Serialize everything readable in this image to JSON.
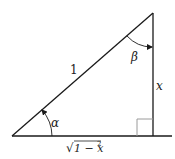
{
  "diagram": {
    "type": "right-triangle",
    "colors": {
      "stroke": "#1a1a1a",
      "right_angle_marker": "#9a9a9a",
      "text": "#222222"
    },
    "labels": {
      "hypotenuse": "1",
      "vertical_side": "x",
      "base": "√1 − x²",
      "base_radicand": "1 − x",
      "base_exponent": "2",
      "base_radical": "√",
      "angle_bottom_left": "α",
      "angle_top": "β"
    },
    "vertices": {
      "bottom_left": [
        12,
        136
      ],
      "top_right": [
        153,
        13
      ],
      "right_angle": [
        153,
        136
      ]
    }
  }
}
